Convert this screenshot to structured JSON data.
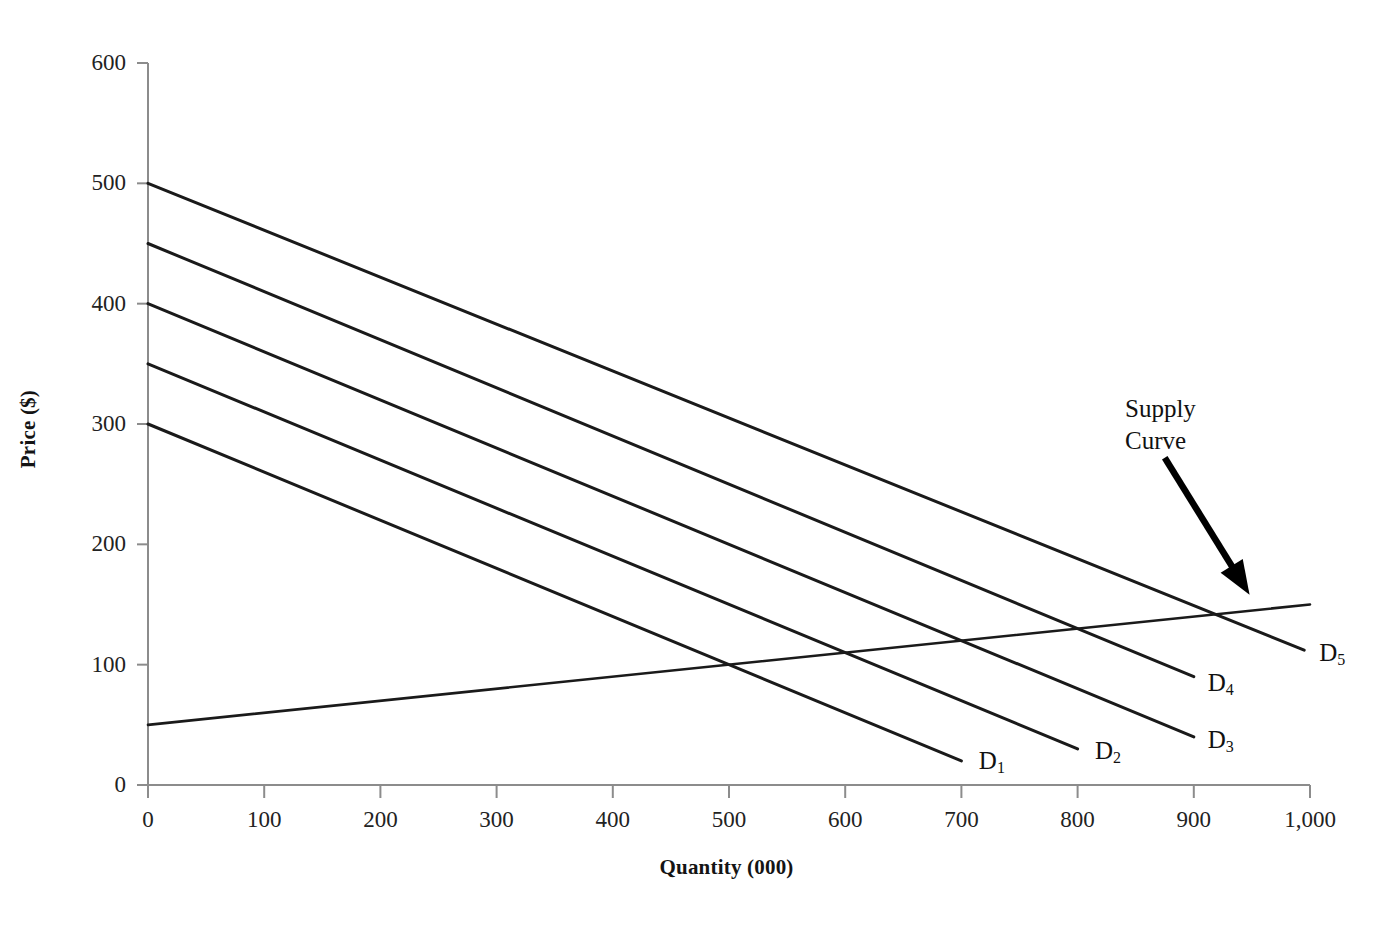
{
  "chart_data": {
    "type": "line",
    "title": "",
    "xlabel": "Quantity (000)",
    "ylabel": "Price ($)",
    "xlim": [
      0,
      1000
    ],
    "ylim": [
      0,
      600
    ],
    "grid": false,
    "legend": "inline-curve-labels",
    "x_ticks": [
      0,
      100,
      200,
      300,
      400,
      500,
      600,
      700,
      800,
      900,
      1000
    ],
    "x_tick_labels": [
      "0",
      "100",
      "200",
      "300",
      "400",
      "500",
      "600",
      "700",
      "800",
      "900",
      "1,000"
    ],
    "y_ticks": [
      0,
      100,
      200,
      300,
      400,
      500,
      600
    ],
    "y_tick_labels": [
      "0",
      "100",
      "200",
      "300",
      "400",
      "500",
      "600"
    ],
    "series": [
      {
        "name": "D1",
        "label": "D",
        "subscript": "1",
        "kind": "demand",
        "points": [
          [
            0,
            300
          ],
          [
            700,
            20
          ]
        ],
        "label_at": [
          715,
          20
        ]
      },
      {
        "name": "D2",
        "label": "D",
        "subscript": "2",
        "kind": "demand",
        "points": [
          [
            0,
            350
          ],
          [
            800,
            30
          ]
        ],
        "label_at": [
          815,
          28
        ]
      },
      {
        "name": "D3",
        "label": "D",
        "subscript": "3",
        "kind": "demand",
        "points": [
          [
            0,
            400
          ],
          [
            900,
            40
          ]
        ],
        "label_at": [
          912,
          37
        ]
      },
      {
        "name": "D4",
        "label": "D",
        "subscript": "4",
        "kind": "demand",
        "points": [
          [
            0,
            450
          ],
          [
            900,
            90
          ]
        ],
        "label_at": [
          912,
          85
        ]
      },
      {
        "name": "D5",
        "label": "D",
        "subscript": "5",
        "kind": "demand",
        "points": [
          [
            0,
            500
          ],
          [
            995,
            112
          ]
        ],
        "label_at": [
          1008,
          110
        ]
      },
      {
        "name": "Supply",
        "label": "Supply Curve",
        "subscript": "",
        "kind": "supply",
        "points": [
          [
            0,
            50
          ],
          [
            1000,
            150
          ]
        ],
        "label_at": [
          0,
          0
        ]
      }
    ],
    "annotations": [
      {
        "name": "supply-curve-callout",
        "text_line_1": "Supply",
        "text_line_2": "Curve",
        "arrow_from": [
          875,
          272
        ],
        "arrow_to": [
          948,
          158
        ]
      }
    ]
  },
  "axes": {
    "x_title": "Quantity (000)",
    "y_title": "Price ($)"
  },
  "style": {
    "axis_color": "#8c8c8c",
    "curve_color": "#1a1a1a",
    "text_color": "#141414",
    "background": "#ffffff",
    "arrow_color": "#000000"
  }
}
